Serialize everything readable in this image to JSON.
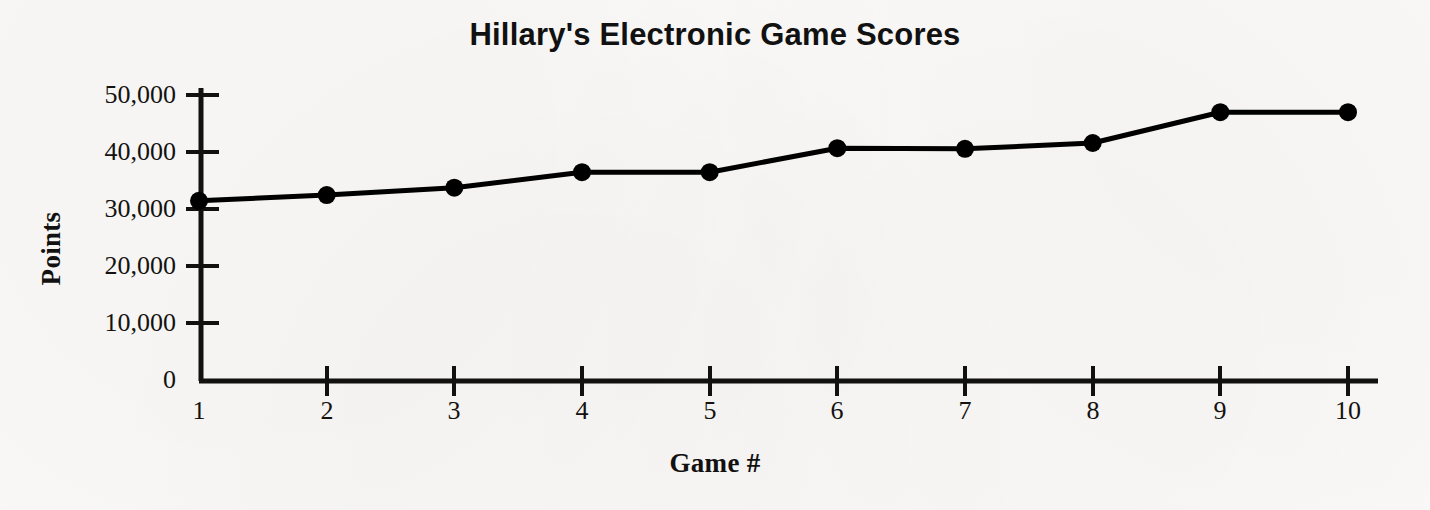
{
  "chart_data": {
    "type": "line",
    "title": "Hillary's Electronic Game Scores",
    "xlabel": "Game #",
    "ylabel": "Points",
    "x": [
      1,
      2,
      3,
      4,
      5,
      6,
      7,
      8,
      9,
      10
    ],
    "categories": [
      "1",
      "2",
      "3",
      "4",
      "5",
      "6",
      "7",
      "8",
      "9",
      "10"
    ],
    "values": [
      31500,
      32500,
      33800,
      36500,
      36500,
      40700,
      40600,
      41600,
      47000,
      47000
    ],
    "series": [
      {
        "name": "Points",
        "values": [
          31500,
          32500,
          33800,
          36500,
          36500,
          40700,
          40600,
          41600,
          47000,
          47000
        ]
      }
    ],
    "xlim": [
      1,
      10
    ],
    "ylim": [
      0,
      52000
    ],
    "x_tick_labels": [
      "1",
      "2",
      "3",
      "4",
      "5",
      "6",
      "7",
      "8",
      "9",
      "10"
    ],
    "y_tick_values": [
      0,
      10000,
      20000,
      30000,
      40000,
      50000
    ],
    "y_tick_labels": [
      "0",
      "10,000",
      "20,000",
      "30,000",
      "40,000",
      "50,000"
    ],
    "grid": false,
    "legend": "none",
    "marker": "filled-circle",
    "line_color": "#000000",
    "marker_color": "#000000",
    "background_color": "#fbfaf8"
  }
}
